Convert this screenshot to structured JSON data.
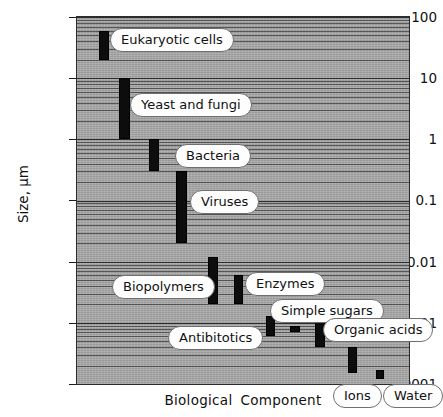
{
  "chart_data": {
    "type": "bar",
    "orientation": "vertical-range",
    "title": "",
    "xlabel": "Biological Component",
    "ylabel": "Size, μm",
    "yscale": "log",
    "ylim": [
      0.0001,
      100
    ],
    "ytick_labels": [
      "100",
      "10",
      "1",
      "0.1",
      "0.01",
      "0.001",
      "0.0001"
    ],
    "ytick_values": [
      100,
      10,
      1,
      0.1,
      0.01,
      0.001,
      0.0001
    ],
    "grid": true,
    "legend": "none",
    "categories": [
      "Eukaryotic cells",
      "Yeast and fungi",
      "Bacteria",
      "Viruses",
      "Biopolymers",
      "Enzymes",
      "Antibitotics",
      "Simple sugars",
      "Organic acids",
      "Ions",
      "Water"
    ],
    "ranges": [
      {
        "name": "Eukaryotic cells",
        "low": 20,
        "high": 60
      },
      {
        "name": "Yeast and fungi",
        "low": 1,
        "high": 10
      },
      {
        "name": "Bacteria",
        "low": 0.3,
        "high": 1.0
      },
      {
        "name": "Viruses",
        "low": 0.02,
        "high": 0.3
      },
      {
        "name": "Biopolymers",
        "low": 0.002,
        "high": 0.012
      },
      {
        "name": "Enzymes",
        "low": 0.002,
        "high": 0.006
      },
      {
        "name": "Antibitotics",
        "low": 0.0006,
        "high": 0.0013
      },
      {
        "name": "Simple sugars",
        "low": 0.0007,
        "high": 0.0009
      },
      {
        "name": "Organic acids",
        "low": 0.0004,
        "high": 0.0011
      },
      {
        "name": "Ions",
        "low": 0.00015,
        "high": 0.0004
      },
      {
        "name": "Water",
        "low": 0.00012,
        "high": 0.00017
      }
    ],
    "bar_color": "#0d0d0d",
    "plot_background": "#a8a8a8"
  },
  "labels": {
    "eukaryotic_cells": "Eukaryotic cells",
    "yeast_and_fungi": "Yeast and fungi",
    "bacteria": "Bacteria",
    "viruses": "Viruses",
    "biopolymers": "Biopolymers",
    "enzymes": "Enzymes",
    "antibiotics": "Antibitotics",
    "simple_sugars": "Simple sugars",
    "organic_acids": "Organic acids",
    "ions": "Ions",
    "water": "Water"
  },
  "axes": {
    "y_title": "Size, μm",
    "x_title_word1": "Biological",
    "x_title_word2": "Component",
    "y_ticks": [
      "100",
      "10",
      "1",
      "0.1",
      "0.01",
      "0.001",
      "0.0001"
    ]
  }
}
